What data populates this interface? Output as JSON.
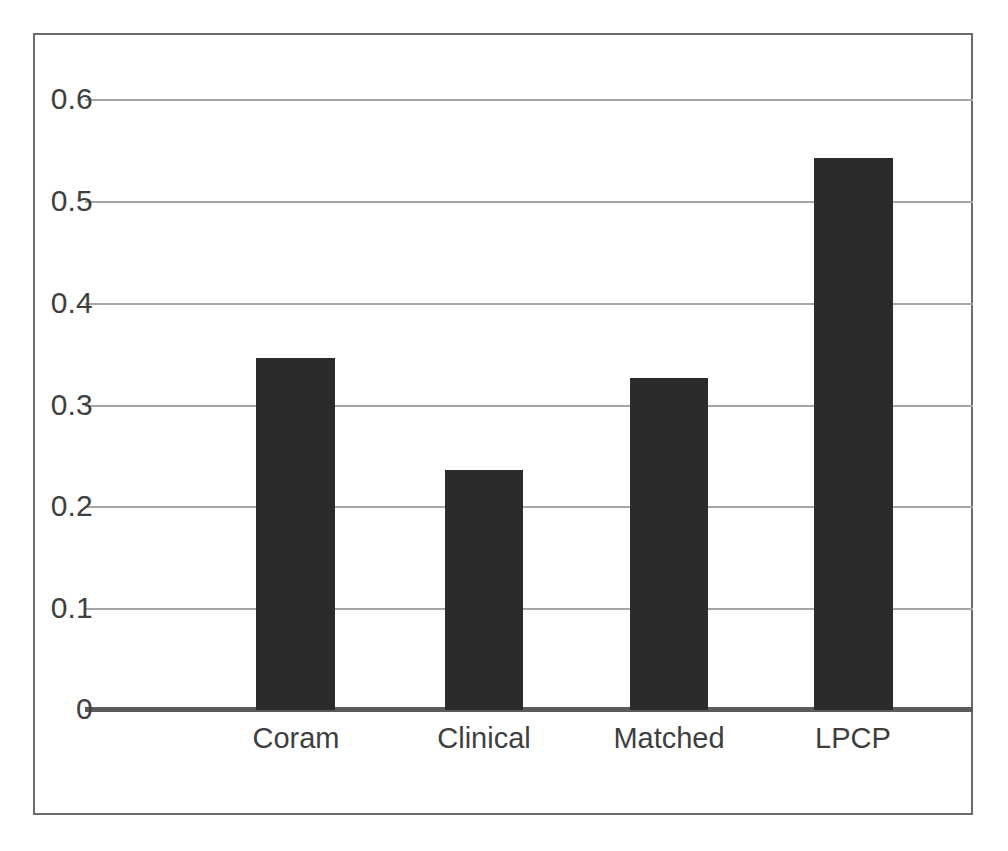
{
  "chart_data": {
    "type": "bar",
    "title": "",
    "subtitle": "",
    "xlabel": "",
    "ylabel": "",
    "categories": [
      "Coram",
      "Clinical",
      "Matched",
      "LPCP"
    ],
    "values": [
      0.346,
      0.236,
      0.326,
      0.542
    ],
    "series": [
      {
        "name": "",
        "values": [
          0.346,
          0.236,
          0.326,
          0.542
        ]
      }
    ],
    "ylim": [
      0,
      0.6
    ],
    "yticks": [
      0,
      0.1,
      0.2,
      0.3,
      0.4,
      0.5,
      0.6
    ],
    "ytick_labels": [
      "0",
      "0.1",
      "0.2",
      "0.3",
      "0.4",
      "0.5",
      "0.6"
    ],
    "grid": true,
    "grid_axis": "y",
    "legend": false,
    "legend_position": "none",
    "bar_color": "#2b2b2b",
    "gridline_color": "#a6a6a6",
    "axis_color": "#5a5a5a",
    "frame_color": "#6b6b6b",
    "background_color": "#ffffff",
    "tick_label_color": "#3f3f3f",
    "annotations": []
  },
  "axes": {
    "y": {
      "ticks": [
        {
          "label": "0.6",
          "value": 0.6
        },
        {
          "label": "0.5",
          "value": 0.5
        },
        {
          "label": "0.4",
          "value": 0.4
        },
        {
          "label": "0.3",
          "value": 0.3
        },
        {
          "label": "0.2",
          "value": 0.2
        },
        {
          "label": "0.1",
          "value": 0.1
        },
        {
          "label": "0",
          "value": 0
        }
      ]
    },
    "x": {
      "ticks": [
        {
          "label": "Coram"
        },
        {
          "label": "Clinical"
        },
        {
          "label": "Matched"
        },
        {
          "label": "LPCP"
        }
      ]
    }
  }
}
